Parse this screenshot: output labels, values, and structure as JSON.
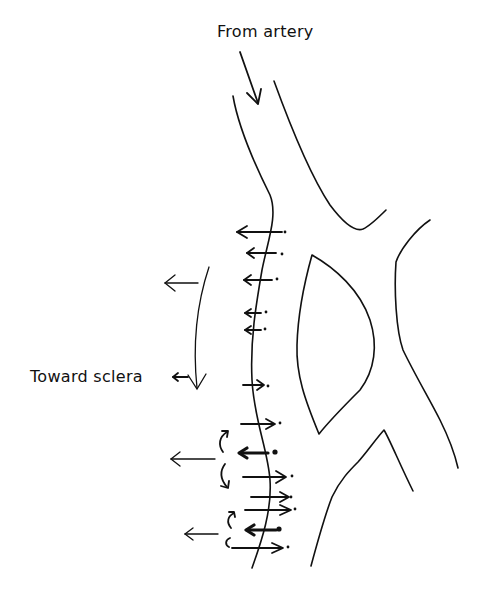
{
  "labels": {
    "from_artery": "From artery",
    "toward_sclera": "Toward sclera"
  },
  "colors": {
    "line": "#111111",
    "background": "#ffffff"
  },
  "diagram": {
    "flow_arrows_left": 5,
    "flow_arrows_right": 6,
    "bold_left_arrows": 2,
    "swirl_pairs": 2
  }
}
